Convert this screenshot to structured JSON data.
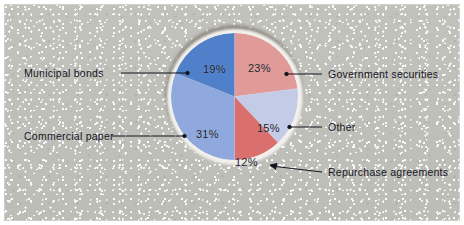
{
  "figure": {
    "background_color": "#bdbdb8",
    "plate_border_color": "#ffffff"
  },
  "chart_data": {
    "type": "pie",
    "title": "",
    "subtitle": "",
    "xlabel": "",
    "ylabel": "",
    "legend_position": "callout-labels",
    "grid": false,
    "start_angle_deg": 0,
    "direction": "clockwise",
    "categories": [
      "Government securities",
      "Other",
      "Repurchase agreements",
      "Commercial paper",
      "Municipal bonds"
    ],
    "values": [
      23,
      15,
      12,
      31,
      19
    ],
    "value_labels": [
      "23%",
      "15%",
      "12%",
      "31%",
      "19%"
    ],
    "colors": [
      "#e09a97",
      "#c3cbe7",
      "#d9706e",
      "#8fa8dd",
      "#5180cb"
    ],
    "slices": [
      {
        "name": "Government securities",
        "value": 23,
        "value_label": "23%",
        "color": "#e09a97",
        "start_deg": 0,
        "end_deg": 82.8
      },
      {
        "name": "Other",
        "value": 15,
        "value_label": "15%",
        "color": "#c3cbe7",
        "start_deg": 82.8,
        "end_deg": 136.8
      },
      {
        "name": "Repurchase agreements",
        "value": 12,
        "value_label": "12%",
        "color": "#d9706e",
        "start_deg": 136.8,
        "end_deg": 180.0
      },
      {
        "name": "Commercial paper",
        "value": 31,
        "value_label": "31%",
        "color": "#8fa8dd",
        "start_deg": 180.0,
        "end_deg": 291.6
      },
      {
        "name": "Municipal bonds",
        "value": 19,
        "value_label": "19%",
        "color": "#5180cb",
        "start_deg": 291.6,
        "end_deg": 360.0
      }
    ]
  },
  "callouts": {
    "municipal_bonds": "Municipal bonds",
    "commercial_paper": "Commercial paper",
    "government_securities": "Government securities",
    "other": "Other",
    "repurchase_agreements": "Repurchase agreements"
  },
  "slice_value_labels": {
    "municipal_bonds": "19%",
    "commercial_paper": "31%",
    "government_securities": "23%",
    "other": "15%",
    "repurchase_agreements": "12%"
  }
}
